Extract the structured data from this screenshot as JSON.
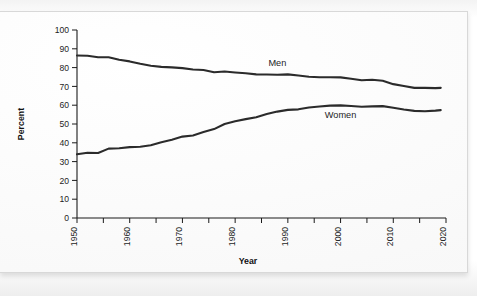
{
  "chart_data": {
    "type": "line",
    "title": "",
    "xlabel": "Year",
    "ylabel": "Percent",
    "xlim": [
      1950,
      2020
    ],
    "ylim": [
      0,
      100
    ],
    "grid": false,
    "legend_position": "inline-labels",
    "y_ticks": [
      0,
      10,
      20,
      30,
      40,
      50,
      60,
      70,
      80,
      90,
      100
    ],
    "y_tick_labels": [
      "0",
      "10",
      "20",
      "30",
      "40",
      "50",
      "60",
      "70",
      "80",
      "90",
      "100"
    ],
    "x_ticks_major": [
      1950,
      1960,
      1970,
      1980,
      1990,
      2000,
      2010,
      2020
    ],
    "x_tick_labels": [
      "1950",
      "1960",
      "1970",
      "1980",
      "1990",
      "2000",
      "2010",
      "2020"
    ],
    "x_ticks_minor": [
      1955,
      1965,
      1975,
      1985,
      1995,
      2005,
      2015
    ],
    "line_color": "#2b2b2b",
    "axis_color": "#1a1a1a",
    "series": [
      {
        "name": "Men",
        "label": "Men",
        "label_x": 1988,
        "label_y": 81,
        "x": [
          1950,
          1952,
          1954,
          1956,
          1958,
          1960,
          1962,
          1964,
          1966,
          1968,
          1970,
          1972,
          1974,
          1976,
          1978,
          1980,
          1982,
          1984,
          1986,
          1988,
          1990,
          1992,
          1994,
          1996,
          1998,
          2000,
          2002,
          2004,
          2006,
          2008,
          2010,
          2012,
          2014,
          2016,
          2018,
          2019
        ],
        "values": [
          86.4,
          86.3,
          85.5,
          85.5,
          84.2,
          83.3,
          82.0,
          81.0,
          80.4,
          80.1,
          79.7,
          79.0,
          78.7,
          77.5,
          77.9,
          77.4,
          77.0,
          76.4,
          76.3,
          76.2,
          76.4,
          75.8,
          75.1,
          74.9,
          74.9,
          74.8,
          74.1,
          73.3,
          73.5,
          73.0,
          71.2,
          70.2,
          69.2,
          69.2,
          69.1,
          69.2
        ]
      },
      {
        "name": "Women",
        "label": "Women",
        "label_x": 2000,
        "label_y": 53,
        "x": [
          1950,
          1952,
          1954,
          1956,
          1958,
          1960,
          1962,
          1964,
          1966,
          1968,
          1970,
          1972,
          1974,
          1976,
          1978,
          1980,
          1982,
          1984,
          1986,
          1988,
          1990,
          1992,
          1994,
          1996,
          1998,
          2000,
          2002,
          2004,
          2006,
          2008,
          2010,
          2012,
          2014,
          2016,
          2018,
          2019
        ],
        "values": [
          33.9,
          34.7,
          34.6,
          36.9,
          37.1,
          37.7,
          37.9,
          38.7,
          40.3,
          41.6,
          43.3,
          43.9,
          45.7,
          47.3,
          50.0,
          51.5,
          52.6,
          53.6,
          55.3,
          56.6,
          57.5,
          57.8,
          58.8,
          59.3,
          59.8,
          59.9,
          59.6,
          59.2,
          59.4,
          59.5,
          58.6,
          57.7,
          57.0,
          56.8,
          57.1,
          57.4
        ]
      }
    ]
  },
  "figure": {
    "y_axis_title": "Percent",
    "x_axis_title": "Year"
  }
}
